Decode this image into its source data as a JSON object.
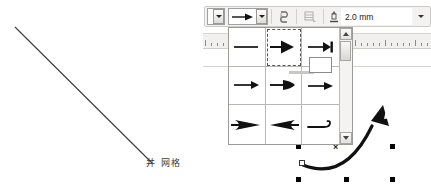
{
  "app": {
    "title": "Drawing canvas with line-ends picker"
  },
  "canvas": {
    "grid_label": {
      "glyph": "井",
      "text": "网格"
    },
    "diagonal_line": {
      "x1": 15,
      "y1": 27,
      "x2": 152,
      "y2": 163,
      "color": "#3b3b3b"
    }
  },
  "ruler": {
    "tick_count": 38,
    "background": "#f1f0ee"
  },
  "toolbar": {
    "line_style_combo": {
      "name": "line-style-combo",
      "value": ""
    },
    "arrow_style_combo": {
      "name": "arrow-style-combo",
      "value": ""
    },
    "buttons": [
      {
        "name": "shadow-button",
        "icon": "shadow-icon",
        "enabled": true
      },
      {
        "name": "crop-button",
        "icon": "crop-icon",
        "enabled": false
      }
    ],
    "line_width": {
      "icon": "line-width-icon",
      "value": "2.0 mm",
      "placeholder": "0.0 mm"
    }
  },
  "arrow_dropdown": {
    "title": "Arrowheads",
    "selected_index": 1,
    "items": [
      {
        "name": "arrowhead-none",
        "label": "None"
      },
      {
        "name": "arrowhead-triangle",
        "label": "Arrow"
      },
      {
        "name": "arrowhead-bar",
        "label": "Arrow with bar"
      },
      {
        "name": "arrowhead-thin",
        "label": "Thin arrow"
      },
      {
        "name": "arrowhead-teardrop",
        "label": "Rounded arrow"
      },
      {
        "name": "arrowhead-small",
        "label": "Small arrow"
      },
      {
        "name": "arrowhead-concave-right",
        "label": "Concave arrow"
      },
      {
        "name": "arrowhead-concave-left",
        "label": "Reversed concave arrow"
      },
      {
        "name": "arrowhead-hook",
        "label": "Hook"
      }
    ],
    "scrollbar": {
      "name": "dropdown-scrollbar",
      "thumb_position": "top"
    }
  },
  "selection": {
    "object_name": "curved-arrow-shape",
    "handle_count": 6,
    "center_marker": "×",
    "handle_color": "#000000"
  },
  "colors": {
    "toolbar_bg": "#f3f2f0",
    "border": "#9d9b97",
    "stroke": "#111111",
    "ruler_bg": "#f1f0ee"
  }
}
